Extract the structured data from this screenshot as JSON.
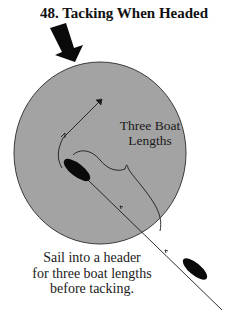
{
  "title": "48.  Tacking When Headed",
  "zone_label": {
    "line1": "Three Boat",
    "line2": "Lengths"
  },
  "caption": {
    "line1": "Sail into a header",
    "line2": "for three boat lengths",
    "line3": "before tacking."
  },
  "colors": {
    "zone_fill": "#a3a3a3",
    "zone_stroke": "#3a3a3a",
    "boat": "#0a0a0a",
    "wind_arrow": "#0a0a0a",
    "track": "#1a1a1a"
  },
  "elements": {
    "wind_arrow": "wind-direction-arrow",
    "zone": "three-boat-length-zone",
    "boat_inside": "boat-after-sailing-header",
    "boat_outside": "boat-approaching",
    "track": "course-track-with-tack",
    "bracket": "three-boat-lengths-bracket"
  }
}
